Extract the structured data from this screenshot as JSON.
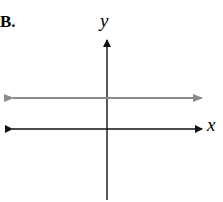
{
  "label": "B.",
  "axes": {
    "x_label": "x",
    "y_label": "y"
  },
  "horizontal_line": {
    "color": "#8a8a8a",
    "description": "horizontal line above x-axis"
  },
  "colors": {
    "axis": "#111111",
    "line": "#8a8a8a"
  }
}
